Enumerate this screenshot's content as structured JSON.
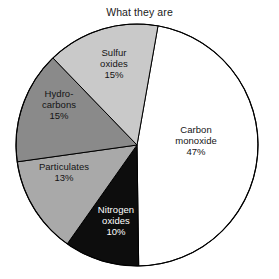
{
  "chart_data": {
    "type": "pie",
    "title": "What they are",
    "xlabel": "",
    "ylabel": "",
    "legend": "none",
    "grid": false,
    "start_angle_deg": 10,
    "direction": "clockwise",
    "categories": [
      "Carbon monoxide",
      "Nitrogen oxides",
      "Particulates",
      "Hydrocarbons",
      "Sulfur oxides"
    ],
    "values": [
      47,
      10,
      13,
      15,
      15
    ],
    "unit": "%",
    "slices": [
      {
        "name": "carbon-monoxide",
        "label_lines": [
          "Carbon",
          "monoxide"
        ],
        "value_label": "47%",
        "value": 47,
        "fill": "#ffffff",
        "stroke": "#000000",
        "text_color": "#141414"
      },
      {
        "name": "nitrogen-oxides",
        "label_lines": [
          "Nitrogen",
          "oxides"
        ],
        "value_label": "10%",
        "value": 10,
        "fill": "#0d0d0d",
        "stroke": "#000000",
        "text_color": "#ffffff"
      },
      {
        "name": "particulates",
        "label_lines": [
          "Particulates"
        ],
        "value_label": "13%",
        "value": 13,
        "fill": "#a9a9a9",
        "stroke": "#000000",
        "text_color": "#141414"
      },
      {
        "name": "hydrocarbons",
        "label_lines": [
          "Hydro-",
          "carbons"
        ],
        "value_label": "15%",
        "value": 15,
        "fill": "#8a8a8a",
        "stroke": "#000000",
        "text_color": "#141414"
      },
      {
        "name": "sulfur-oxides",
        "label_lines": [
          "Sulfur",
          "oxides"
        ],
        "value_label": "15%",
        "value": 15,
        "fill": "#c9c9c9",
        "stroke": "#000000",
        "text_color": "#141414"
      }
    ]
  }
}
